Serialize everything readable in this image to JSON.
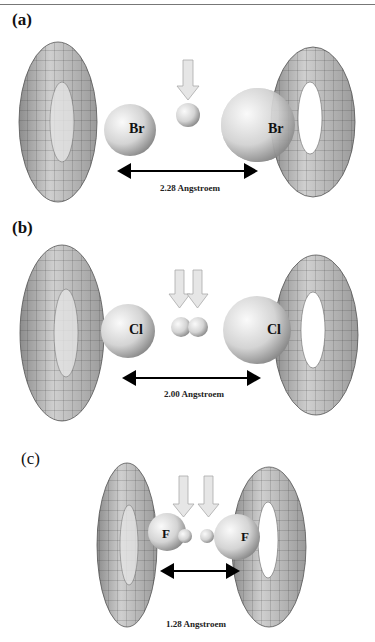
{
  "figure": {
    "panels": [
      {
        "label": "(a)",
        "atom": "Br",
        "distance": "2.28 Angstroem",
        "arrows": 1,
        "spheres": 1
      },
      {
        "label": "(b)",
        "atom": "Cl",
        "distance": "2.00 Angstroem",
        "arrows": 2,
        "spheres": 2
      },
      {
        "label": "(c)",
        "atom": "F",
        "distance": "1.28 Angstroem",
        "arrows": 2,
        "spheres": 2
      }
    ]
  },
  "colors": {
    "torus": "#9a9a9a",
    "sphere": "#d8d8d8",
    "arrow_fill": "#e6e6e6",
    "arrow_stroke": "#aaaaaa",
    "mesh": "#333333"
  }
}
